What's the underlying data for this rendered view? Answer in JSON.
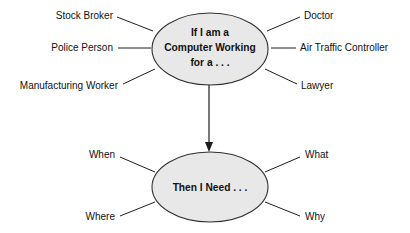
{
  "diagram": {
    "canvas": {
      "width": 410,
      "height": 233,
      "background": "#ffffff"
    },
    "colors": {
      "node_fill": "#e8e8e8",
      "node_stroke": "#303030",
      "line": "#1d1d1d",
      "text": "#111111"
    },
    "nodes": [
      {
        "id": "top-node",
        "shape": "ellipse",
        "lines": [
          "If I am a",
          "Computer Working",
          "for a . . ."
        ],
        "line1": "If I am a",
        "line2": "Computer Working",
        "line3": "for a . . ."
      },
      {
        "id": "bottom-node",
        "shape": "ellipse",
        "lines": [
          "Then I Need . . ."
        ],
        "line1": "Then I Need . . ."
      }
    ],
    "top_spokes": {
      "left": [
        {
          "label": "Stock Broker"
        },
        {
          "label": "Police Person"
        },
        {
          "label": "Manufacturing Worker"
        }
      ],
      "right": [
        {
          "label": "Doctor"
        },
        {
          "label": "Air Traffic Controller"
        },
        {
          "label": "Lawyer"
        }
      ]
    },
    "bottom_spokes": {
      "left": [
        {
          "label": "When"
        },
        {
          "label": "Where"
        }
      ],
      "right": [
        {
          "label": "What"
        },
        {
          "label": "Why"
        }
      ]
    },
    "flow": {
      "from": "top-node",
      "to": "bottom-node",
      "direction": "down",
      "arrowhead": "filled-triangle"
    }
  }
}
